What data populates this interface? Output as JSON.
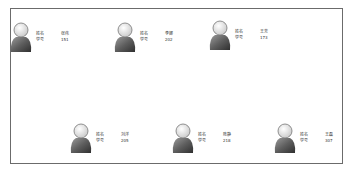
{
  "labels": {
    "name": "姓名",
    "id": "学号"
  },
  "users": [
    {
      "name": "张伟",
      "id": "151",
      "pos": [
        8,
        20
      ]
    },
    {
      "name": "李娜",
      "id": "202",
      "pos": [
        112,
        20
      ]
    },
    {
      "name": "王芳",
      "id": "173",
      "pos": [
        207,
        18
      ]
    },
    {
      "name": "刘洋",
      "id": "205",
      "pos": [
        68,
        121
      ]
    },
    {
      "name": "陈静",
      "id": "218",
      "pos": [
        170,
        121
      ]
    },
    {
      "name": "王磊",
      "id": "307",
      "pos": [
        272,
        121
      ]
    }
  ]
}
